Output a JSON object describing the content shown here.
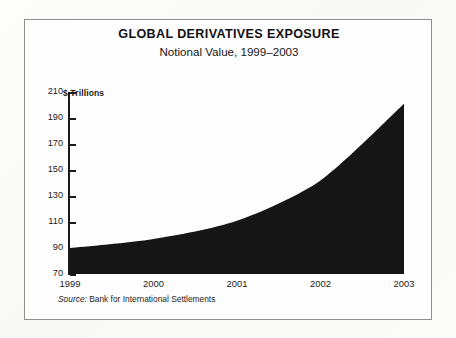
{
  "figure": {
    "title": "GLOBAL DERIVATIVES EXPOSURE",
    "subtitle": "Notional Value, 1999–2003",
    "source_label": "Source:",
    "source_text": "Bank for International Settlements",
    "frame_color": "#8e8e8e",
    "ink_color": "#1a1a1a",
    "paper_color": "#fefefe"
  },
  "chart_data": {
    "type": "area",
    "title": "GLOBAL DERIVATIVES EXPOSURE",
    "subtitle": "Notional Value, 1999–2003",
    "xlabel": "",
    "ylabel": "$ Trillions",
    "ylim": [
      70,
      210
    ],
    "xlim": [
      1999,
      2003
    ],
    "yticks": [
      210,
      190,
      170,
      150,
      130,
      110,
      90,
      70
    ],
    "ytick_labels": [
      "210",
      "190",
      "170",
      "150",
      "130",
      "110",
      "90",
      "70"
    ],
    "xticks": [
      1999,
      2000,
      2001,
      2002,
      2003
    ],
    "xtick_labels": [
      "1999",
      "2000",
      "2001",
      "2002",
      "2003"
    ],
    "grid": false,
    "legend": false,
    "fill_color": "#151515",
    "categories": [
      "1999",
      "2000",
      "2001",
      "2002",
      "2003"
    ],
    "x": [
      1999,
      2000,
      2001,
      2002,
      2003
    ],
    "values": [
      90,
      97,
      111,
      142,
      201
    ],
    "series": [
      {
        "name": "Notional Value ($ Trillions)",
        "values": [
          90,
          97,
          111,
          142,
          201
        ]
      }
    ],
    "annotations": []
  }
}
